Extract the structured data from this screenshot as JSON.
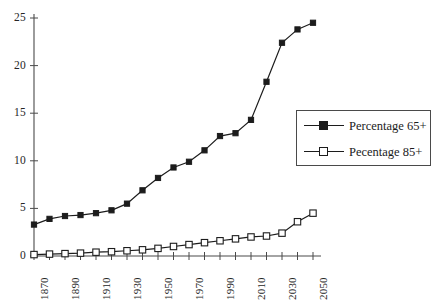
{
  "chart_data": {
    "type": "line",
    "title": "",
    "subtitle": "",
    "xlabel": "",
    "ylabel": "",
    "xlim": [
      1870,
      2050
    ],
    "ylim": [
      0,
      25
    ],
    "yticks": [
      0,
      5,
      10,
      15,
      20,
      25
    ],
    "xticks": [
      1870,
      1880,
      1890,
      1900,
      1910,
      1920,
      1930,
      1940,
      1950,
      1960,
      1970,
      1980,
      1990,
      2000,
      2010,
      2020,
      2030,
      2040,
      2050
    ],
    "xtick_labels": [
      "1870",
      "1890",
      "1910",
      "1930",
      "1950",
      "1970",
      "1990",
      "2010",
      "2030",
      "2050"
    ],
    "xtick_label_values": [
      1870,
      1890,
      1910,
      1930,
      1950,
      1970,
      1990,
      2010,
      2030,
      2050
    ],
    "xtick_label_rotation": -90,
    "grid": false,
    "legend_position": "right",
    "x": [
      1870,
      1880,
      1890,
      1900,
      1910,
      1920,
      1930,
      1940,
      1950,
      1960,
      1970,
      1980,
      1990,
      2000,
      2010,
      2020,
      2030,
      2040,
      2050
    ],
    "series": [
      {
        "name": "Percentage 65+",
        "marker": "filled-square",
        "color": "#1c1c1c",
        "values": [
          3.3,
          3.9,
          4.2,
          4.3,
          4.5,
          4.8,
          5.5,
          6.9,
          8.2,
          9.3,
          9.9,
          11.1,
          12.6,
          12.9,
          14.3,
          18.3,
          22.4,
          23.8,
          24.5
        ]
      },
      {
        "name": "Pecentage 85+",
        "marker": "hollow-square",
        "color": "#1c1c1c",
        "values": [
          0.15,
          0.2,
          0.25,
          0.3,
          0.4,
          0.45,
          0.55,
          0.65,
          0.8,
          1.0,
          1.2,
          1.4,
          1.6,
          1.8,
          2.0,
          2.1,
          2.4,
          3.6,
          4.5
        ]
      }
    ],
    "annotations": []
  },
  "legend": {
    "entries": [
      {
        "label": "Percentage 65+"
      },
      {
        "label": "Pecentage 85+"
      }
    ]
  },
  "axes": {
    "y_tick_labels": [
      "25",
      "20",
      "15",
      "10",
      "5",
      "0"
    ],
    "x_tick_labels": [
      "1870",
      "1890",
      "1910",
      "1930",
      "1950",
      "1970",
      "1990",
      "2010",
      "2030",
      "2050"
    ]
  },
  "colors": {
    "ink": "#1c1c1c",
    "axis": "#4a4a4a",
    "background": "#ffffff"
  }
}
